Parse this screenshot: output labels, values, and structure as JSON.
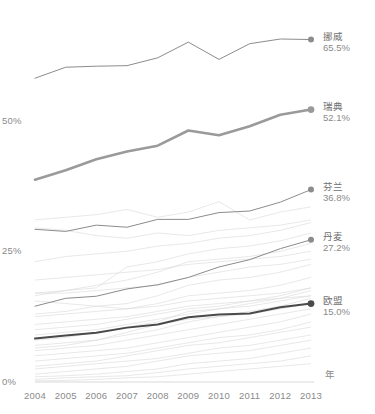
{
  "chart_data": {
    "type": "line",
    "title": "",
    "subtitle": "",
    "xlabel": "年",
    "ylabel": "",
    "x": [
      2004,
      2005,
      2006,
      2007,
      2008,
      2009,
      2010,
      2011,
      2012,
      2013
    ],
    "xticklabels": [
      "2004",
      "2005",
      "2006",
      "2007",
      "2008",
      "2009",
      "2010",
      "2011",
      "2012",
      "2013"
    ],
    "yticks": [
      0,
      25,
      50
    ],
    "yticklabels": [
      "0%",
      "25%",
      "50%"
    ],
    "ylim": [
      0,
      70
    ],
    "xlim": [
      2004,
      2013
    ],
    "grid": false,
    "legend_position": "right-end-of-line",
    "highlight_color": "#8c8c8c",
    "emphasis_color": "#4a4a4a",
    "background_line_color": "#d8d8d8",
    "series": [
      {
        "name": "挪威",
        "value_label": "65.5%",
        "final_value": 65.5,
        "emphasis": "thin-dark",
        "values": [
          58.1,
          60.2,
          60.4,
          60.5,
          62.0,
          65.0,
          61.7,
          64.7,
          65.6,
          65.5
        ]
      },
      {
        "name": "瑞典",
        "value_label": "52.1%",
        "final_value": 52.1,
        "emphasis": "thick",
        "values": [
          38.7,
          40.5,
          42.6,
          44.1,
          45.2,
          48.1,
          47.2,
          48.9,
          51.1,
          52.1
        ]
      },
      {
        "name": "芬兰",
        "value_label": "36.8%",
        "final_value": 36.8,
        "emphasis": "thin-dark",
        "values": [
          29.2,
          28.8,
          30.0,
          29.6,
          31.1,
          31.1,
          32.4,
          32.7,
          34.4,
          36.8
        ]
      },
      {
        "name": "丹麦",
        "value_label": "27.2%",
        "final_value": 27.2,
        "emphasis": "thin-dark",
        "values": [
          14.5,
          16.0,
          16.4,
          17.8,
          18.6,
          20.0,
          22.0,
          23.4,
          25.5,
          27.2
        ]
      },
      {
        "name": "欧盟",
        "value_label": "15.0%",
        "final_value": 15.0,
        "emphasis": "thick-dark",
        "values": [
          8.3,
          8.9,
          9.4,
          10.4,
          11.0,
          12.4,
          12.9,
          13.1,
          14.3,
          15.0
        ]
      }
    ],
    "background_series": [
      {
        "name": "bg-01",
        "values": [
          31.0,
          31.5,
          32.0,
          33.0,
          31.5,
          32.5,
          34.5,
          31.0,
          32.5,
          33.5
        ]
      },
      {
        "name": "bg-02",
        "values": [
          29.5,
          29.0,
          28.0,
          27.5,
          28.5,
          28.0,
          29.0,
          29.5,
          30.0,
          31.0
        ]
      },
      {
        "name": "bg-03",
        "values": [
          17.0,
          17.5,
          18.0,
          22.0,
          23.0,
          24.5,
          25.5,
          26.0,
          27.0,
          28.5
        ]
      },
      {
        "name": "bg-04",
        "values": [
          23.0,
          24.0,
          24.5,
          25.0,
          26.0,
          26.5,
          27.5,
          28.0,
          29.0,
          30.5
        ]
      },
      {
        "name": "bg-05",
        "values": [
          16.5,
          17.5,
          18.5,
          19.5,
          21.0,
          23.0,
          23.5,
          24.0,
          25.0,
          26.5
        ]
      },
      {
        "name": "bg-06",
        "values": [
          17.0,
          17.0,
          17.5,
          18.0,
          18.5,
          20.0,
          21.0,
          22.0,
          22.5,
          23.5
        ]
      },
      {
        "name": "bg-07",
        "values": [
          13.0,
          13.5,
          14.5,
          15.0,
          16.5,
          18.5,
          19.5,
          20.0,
          21.0,
          22.5
        ]
      },
      {
        "name": "bg-08",
        "values": [
          15.5,
          15.0,
          14.5,
          14.0,
          14.5,
          15.5,
          16.0,
          16.5,
          17.0,
          18.0
        ]
      },
      {
        "name": "bg-09",
        "values": [
          12.5,
          13.0,
          13.5,
          14.0,
          15.0,
          16.5,
          17.0,
          17.5,
          18.5,
          20.0
        ]
      },
      {
        "name": "bg-10",
        "values": [
          10.0,
          10.5,
          11.0,
          12.0,
          13.0,
          14.0,
          14.5,
          15.5,
          16.5,
          18.0
        ]
      },
      {
        "name": "bg-11",
        "values": [
          9.0,
          9.5,
          10.0,
          11.0,
          12.0,
          13.0,
          14.0,
          15.0,
          16.0,
          17.5
        ]
      },
      {
        "name": "bg-12",
        "values": [
          8.0,
          8.5,
          9.5,
          10.5,
          11.5,
          13.5,
          14.0,
          14.5,
          15.5,
          16.5
        ]
      },
      {
        "name": "bg-13",
        "values": [
          7.0,
          7.5,
          8.0,
          9.0,
          10.0,
          11.5,
          12.5,
          13.0,
          14.0,
          15.0
        ]
      },
      {
        "name": "bg-14",
        "values": [
          6.0,
          6.5,
          7.0,
          8.0,
          9.0,
          10.0,
          11.0,
          12.0,
          13.0,
          14.0
        ]
      },
      {
        "name": "bg-15",
        "values": [
          5.0,
          5.5,
          6.0,
          6.5,
          7.5,
          8.5,
          9.5,
          10.5,
          11.5,
          13.0
        ]
      },
      {
        "name": "bg-16",
        "values": [
          4.0,
          4.5,
          5.0,
          5.5,
          6.5,
          7.5,
          8.5,
          9.0,
          10.0,
          11.5
        ]
      },
      {
        "name": "bg-17",
        "values": [
          3.0,
          3.5,
          4.0,
          5.0,
          6.0,
          7.0,
          7.5,
          8.5,
          9.5,
          10.5
        ]
      },
      {
        "name": "bg-18",
        "values": [
          2.5,
          3.0,
          3.5,
          4.0,
          4.5,
          5.5,
          6.5,
          7.0,
          8.0,
          9.0
        ]
      },
      {
        "name": "bg-19",
        "values": [
          1.5,
          2.0,
          2.5,
          3.0,
          4.0,
          5.0,
          5.5,
          6.0,
          7.0,
          8.0
        ]
      },
      {
        "name": "bg-20",
        "values": [
          1.0,
          1.2,
          1.5,
          2.0,
          2.5,
          3.5,
          4.0,
          4.5,
          5.5,
          6.5
        ]
      },
      {
        "name": "bg-21",
        "values": [
          0.5,
          0.8,
          1.0,
          1.2,
          1.8,
          2.5,
          3.0,
          3.5,
          4.0,
          5.0
        ]
      },
      {
        "name": "bg-22",
        "values": [
          0.2,
          0.3,
          0.5,
          0.8,
          1.0,
          1.5,
          2.0,
          2.5,
          3.0,
          3.5
        ]
      },
      {
        "name": "bg-23",
        "values": [
          11.0,
          11.5,
          12.0,
          12.5,
          13.5,
          14.5,
          15.0,
          15.5,
          16.0,
          16.5
        ]
      },
      {
        "name": "bg-24",
        "values": [
          19.5,
          20.0,
          20.5,
          21.0,
          21.5,
          22.5,
          23.0,
          23.5,
          24.0,
          25.0
        ]
      },
      {
        "name": "bg-25",
        "values": [
          6.5,
          7.0,
          8.0,
          9.5,
          11.0,
          12.0,
          12.5,
          13.5,
          14.5,
          16.0
        ]
      }
    ]
  }
}
